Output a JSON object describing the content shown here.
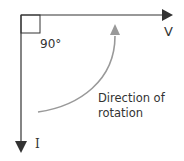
{
  "diagram": {
    "type": "phasor-diagram",
    "axes": {
      "horizontal": {
        "label": "V",
        "direction": "right"
      },
      "vertical": {
        "label": "I",
        "direction": "down"
      }
    },
    "angle_label": "90°",
    "rotation_label_line1": "Direction of",
    "rotation_label_line2": "rotation",
    "colors": {
      "axis": "#333333",
      "rotation_arrow": "#999999",
      "text": "#333333"
    }
  }
}
